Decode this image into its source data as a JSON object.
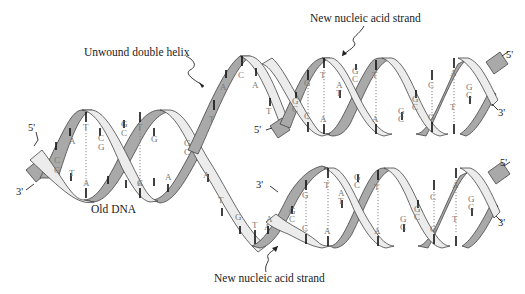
{
  "diagram": {
    "labels": {
      "unwound": "Unwound double helix",
      "new_strand_top": "New nucleic acid strand",
      "new_strand_bottom": "New nucleic acid strand",
      "old_dna": "Old DNA"
    },
    "ends": {
      "left_5": "5'",
      "left_3": "3'",
      "top_inner_5": "5'",
      "top_right_5": "5'",
      "top_right_3": "3'",
      "bottom_inner_3": "3'",
      "bottom_right_5": "5'",
      "bottom_right_3": "3'"
    },
    "old_dna_bases": {
      "pairs": [
        {
          "top": "C",
          "bottom": "G"
        },
        {
          "top": "A",
          "bottom": "T"
        },
        {
          "top": "T",
          "bottom": "A"
        },
        {
          "top": "C",
          "bottom": "G"
        },
        {
          "top": "G",
          "bottom": "C"
        },
        {
          "top": "T",
          "bottom": "A"
        },
        {
          "top": "G",
          "bottom": "C"
        },
        {
          "top": "A",
          "bottom": "T"
        },
        {
          "top": "G",
          "bottom": "C"
        }
      ]
    },
    "unwound_upper_bases": [
      "T",
      "A",
      "C",
      "A",
      "T"
    ],
    "unwound_lower_bases": [
      "A",
      "T",
      "G",
      "T",
      "A"
    ],
    "top_helix_bases": {
      "pairs": [
        {
          "top": "G",
          "bottom": "C"
        },
        {
          "top": "G",
          "bottom": "C"
        },
        {
          "top": "T",
          "bottom": "A"
        },
        {
          "top": "A",
          "bottom": "T"
        },
        {
          "top": "C",
          "bottom": "G"
        },
        {
          "top": "T",
          "bottom": "A"
        },
        {
          "top": "G",
          "bottom": "C"
        },
        {
          "top": "G",
          "bottom": "C"
        },
        {
          "top": "C",
          "bottom": "G"
        },
        {
          "top": "A",
          "bottom": "T"
        },
        {
          "top": "G",
          "bottom": "C"
        }
      ]
    },
    "bottom_helix_bases": {
      "pairs": [
        {
          "top": "G",
          "bottom": "C"
        },
        {
          "top": "G",
          "bottom": "C"
        },
        {
          "top": "T",
          "bottom": "A"
        },
        {
          "top": "A",
          "bottom": "T"
        },
        {
          "top": "C",
          "bottom": "G"
        },
        {
          "top": "T",
          "bottom": "A"
        },
        {
          "top": "T",
          "bottom": "A"
        },
        {
          "top": "G",
          "bottom": "C"
        },
        {
          "top": "G",
          "bottom": "C"
        },
        {
          "top": "C",
          "bottom": "G"
        },
        {
          "top": "A",
          "bottom": "T"
        },
        {
          "top": "G",
          "bottom": "C"
        }
      ]
    },
    "colors": {
      "dark_strand": "#a9a9a9",
      "light_strand": "#ececec",
      "outline": "#444444",
      "base_text": "#777777",
      "label_text": "#222222"
    }
  }
}
